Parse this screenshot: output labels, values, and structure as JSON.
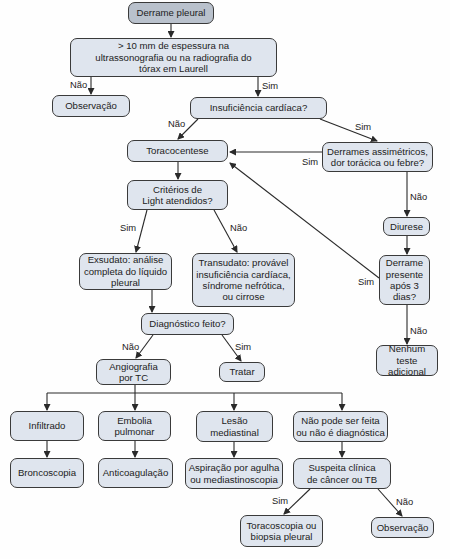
{
  "nodes": {
    "start": "Derrame pleural",
    "thickness": "> 10 mm de espessura na ultrassonografia ou na radiografia do tórax em Laurell",
    "observation1": "Observação",
    "heart_failure": "Insuficiência cardíaca?",
    "thoracentesis": "Toracocentese",
    "asymmetric": "Derrames assimétricos, dor torácica ou febre?",
    "light_criteria": "Critérios de Light atendidos?",
    "diuresis": "Diurese",
    "exudate": "Exsudato: análise completa do líquido pleural",
    "transudate": "Transudato: provável insuficiência cardíaca, síndrome nefrótica, ou cirrose",
    "effusion_3days": "Derrame presente após 3 dias?",
    "diagnosis_made": "Diagnóstico feito?",
    "no_further_test": "Nenhum teste adicional",
    "ct_angiography": "Angiografia por TC",
    "treat": "Tratar",
    "infiltrate": "Infiltrado",
    "pulmonary_embolism": "Embolia pulmonar",
    "mediastinal_lesion": "Lesão mediastinal",
    "not_diagnostic": "Não pode ser feita ou não é diagnóstica",
    "bronchoscopy": "Broncoscopia",
    "anticoagulation": "Anticoagulação",
    "needle_aspiration": "Aspiração por agulha ou mediastinoscopia",
    "suspected_cancer_tb": "Suspeita clínica de câncer ou TB",
    "thoracoscopy": "Toracoscopia ou biopsia pleural",
    "observation2": "Observação"
  },
  "edge_labels": {
    "yes": "Sim",
    "no": "Não"
  },
  "colors": {
    "start_fill": "#b9c1cc",
    "node_fill": "#dfe5ee",
    "border": "#3a3a3a",
    "line": "#2a2a2a"
  }
}
